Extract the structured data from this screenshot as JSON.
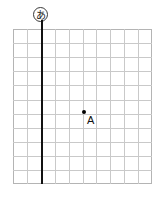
{
  "figure": {
    "type": "coordinate-grid-diagram",
    "background_color": "#ffffff",
    "grid": {
      "columns": 10,
      "rows": 11,
      "cell_width": 13.9,
      "cell_height": 14.1,
      "line_color": "#c9c9c9",
      "border_color": "#b4b4b4",
      "left": 13,
      "top": 29,
      "width": 139,
      "height": 155
    },
    "axis": {
      "label": "あ",
      "label_name": "circled-hiragana-a",
      "orientation": "vertical",
      "color": "#111111",
      "x_position": 41,
      "column_index": 2
    },
    "points": [
      {
        "label": "A",
        "name": "point-a",
        "x": 84,
        "y": 112,
        "color": "#000000",
        "label_x": 88,
        "label_y": 115
      }
    ]
  }
}
